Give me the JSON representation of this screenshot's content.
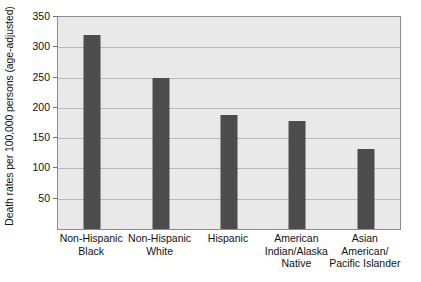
{
  "chart_data": {
    "type": "bar",
    "title": "",
    "xlabel": "",
    "ylabel": "Death rates per 100,000 persons (age-adjusted)",
    "categories": [
      "Non-Hispanic Black",
      "Non-Hispanic White",
      "Hispanic",
      "American Indian/Alaska Native",
      "Asian American/ Pacific Islander"
    ],
    "category_lines": [
      [
        "Non-Hispanic",
        "Black"
      ],
      [
        "Non-Hispanic",
        "White"
      ],
      [
        "Hispanic"
      ],
      [
        "American",
        "Indian/Alaska",
        "Native"
      ],
      [
        "Asian",
        "American/",
        "Pacific Islander"
      ]
    ],
    "values": [
      320,
      250,
      188,
      178,
      132
    ],
    "ylim": [
      0,
      350
    ],
    "yticks": [
      50,
      100,
      150,
      200,
      250,
      300,
      350
    ],
    "ytick_labels": [
      "50",
      "100",
      "150",
      "200",
      "250",
      "300",
      "350"
    ],
    "grid": true,
    "legend": "none",
    "bar_color": "#4c4c4c",
    "plot_background": "#e9e9e9",
    "gridline_color": "#b9b9b9",
    "axis_color": "#8c8c8c"
  }
}
